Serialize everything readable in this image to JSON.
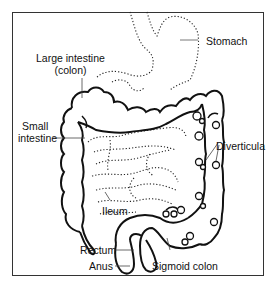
{
  "diagram": {
    "type": "anatomical-illustration",
    "stroke_color": "#111111",
    "background": "#ffffff",
    "labels": {
      "large_intestine_line1": "Large intestine",
      "large_intestine_line2": "(colon)",
      "stomach": "Stomach",
      "small_intestine_line1": "Small",
      "small_intestine_line2": "intestine",
      "diverticula": "Diverticula",
      "ileum": "Ileum",
      "rectum": "Rectum",
      "anus": "Anus",
      "sigmoid_colon": "Sigmoid colon"
    }
  }
}
